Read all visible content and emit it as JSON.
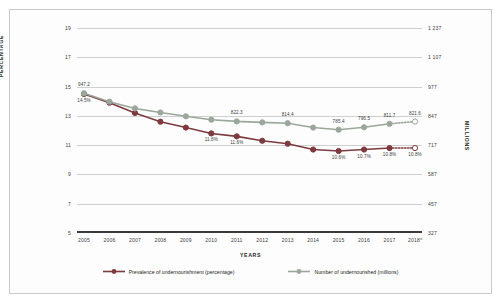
{
  "chart_data": {
    "type": "line",
    "title": "",
    "xlabel": "YEARS",
    "ylabel": "PERCENTAGE",
    "y2label": "MILLIONS",
    "grid": true,
    "legend_position": "bottom",
    "categories": [
      "2005",
      "2006",
      "2007",
      "2008",
      "2009",
      "2010",
      "2011",
      "2012",
      "2013",
      "2014",
      "2015",
      "2016",
      "2017",
      "2018*"
    ],
    "yticks_left": [
      "19",
      "17",
      "15",
      "13",
      "11",
      "9",
      "7",
      "5"
    ],
    "ylim_left": [
      5,
      19
    ],
    "yticks_right": [
      "1 237",
      "1 107",
      "977",
      "847",
      "717",
      "587",
      "457",
      "327"
    ],
    "ylim_right": [
      327,
      1237
    ],
    "series": [
      {
        "name": "Prevalence of undernourishment (percentage)",
        "color": "#7d3a3f",
        "axis": "left",
        "values": [
          14.5,
          13.9,
          13.2,
          12.6,
          12.2,
          11.8,
          11.6,
          11.3,
          11.1,
          10.7,
          10.6,
          10.7,
          10.8,
          10.8
        ],
        "labels": [
          "14.5%",
          "",
          "",
          "",
          "",
          "11.8%",
          "11.6%",
          "",
          "",
          "",
          "10.6%",
          "10.7%",
          "10.8%",
          "10.8%"
        ],
        "label_side": [
          "below",
          "",
          "",
          "",
          "",
          "below",
          "below",
          "",
          "",
          "",
          "below",
          "below",
          "below",
          "below"
        ],
        "projected_from": "2017"
      },
      {
        "name": "Number of undernourished (millions)",
        "color": "#9aa79a",
        "axis": "right",
        "values": [
          947.2,
          910.0,
          880.0,
          862.0,
          845.0,
          830.0,
          822.3,
          818.0,
          814.4,
          795.0,
          785.4,
          796.5,
          811.7,
          821.6
        ],
        "labels": [
          "947.2",
          "",
          "",
          "",
          "",
          "",
          "822.3",
          "",
          "814.4",
          "",
          "785.4",
          "796.5",
          "811.7",
          "821.6"
        ],
        "label_side": [
          "above",
          "",
          "",
          "",
          "",
          "",
          "above",
          "",
          "above",
          "",
          "above",
          "above",
          "above",
          "above"
        ],
        "projected_from": "2017"
      }
    ]
  },
  "legend": {
    "items": [
      {
        "label": "Prevalence of undernourishment (percentage)",
        "color": "#7d3a3f"
      },
      {
        "label": "Number of undernourished (millions)",
        "color": "#9aa79a"
      }
    ]
  }
}
